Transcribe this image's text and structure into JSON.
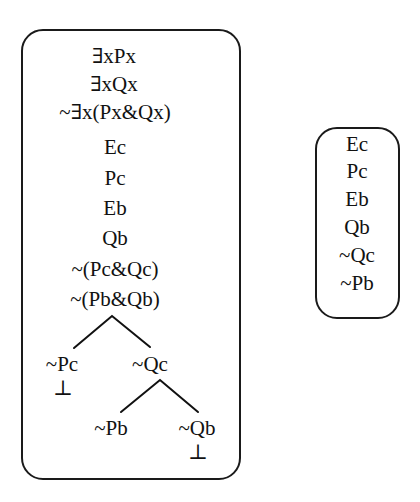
{
  "left_tree": {
    "trunk": [
      "∃xPx",
      "∃xQx",
      "~∃x(Px&Qx)",
      "Ec",
      "Pc",
      "Eb",
      "Qb",
      "~(Pc&Qc)",
      "~(Pb&Qb)"
    ],
    "branch1": {
      "left": "~Pc",
      "left_closed": "⊥",
      "right": "~Qc"
    },
    "branch2": {
      "left": "~Pb",
      "right": "~Qb",
      "right_closed": "⊥"
    }
  },
  "right_box": {
    "lines": [
      "Ec",
      "Pc",
      "Eb",
      "Qb",
      "~Qc",
      "~Pb"
    ]
  }
}
